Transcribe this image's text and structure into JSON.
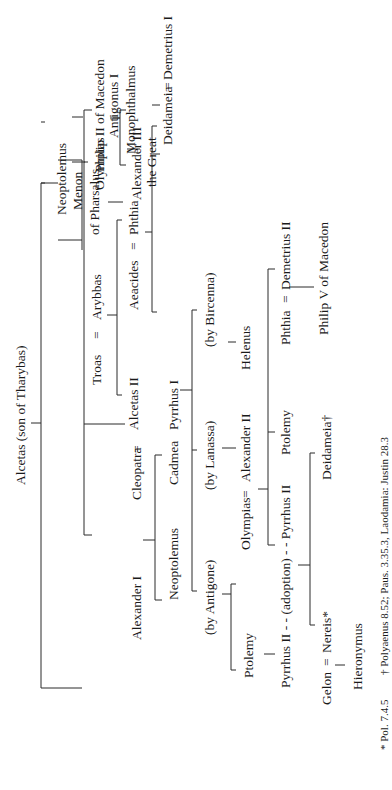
{
  "figure": {
    "orientation": "rotated-90-ccw",
    "root": "Alcetas (son of Tharybas)",
    "people": {
      "alcetas": "Alcetas  (son of Tharybas)",
      "neoptolemus_1": "Neoptolemus",
      "olympias": "Olympias",
      "philip_ii": "Philip II of Macedon",
      "alexander_iii_a": "Alexander III",
      "alexander_iii_b": "the Great",
      "cleopatra": "Cleopatra",
      "alexander_i": "Alexander I",
      "neoptolemus_2": "Neoptolemus",
      "cadmea": "Cadmea",
      "troas": "Troas",
      "arybbas": "Arybbas",
      "alcetas_ii": "Alcetas II",
      "aeacides": "Aeacides",
      "phthia_1": "Phthia",
      "menon_a": "Menon",
      "menon_b": "of Pharsalus",
      "deidameia_1": "Deidameia",
      "demetrius_i": "Demetrius I",
      "antigonus_a": "Antigonus I",
      "antigonus_b": "Monophthalmus",
      "pyrrhus_i": "Pyrrhus I",
      "by_antigone": "(by Antigone)",
      "by_lanassa": "(by Lanassa)",
      "by_bircenna": "(by Bircenna)",
      "helenus": "Helenus",
      "ptolemy_1": "Ptolemy",
      "pyrrhus_ii_adopt": "Pyrrhus II  - - (adoption) - -  Pyrrhus II",
      "olympias_2": "Olympias",
      "alexander_ii": "Alexander II",
      "ptolemy_2": "Ptolemy",
      "phthia_2": "Phthia",
      "demetrius_ii": "Demetrius II",
      "philip_v": "Philip V of Macedon",
      "gelon": "Gelon",
      "nereis": "Nereis*",
      "hieronymus": "Hieronymus",
      "deidameia_2": "Deidameia†"
    },
    "marriage_sign": "=",
    "footnotes": {
      "star": "* Pol. 7.4.5",
      "dagger": "† Polyaenus 8.52; Paus. 3.35.3, Laodamia: Justin 28.3"
    }
  }
}
